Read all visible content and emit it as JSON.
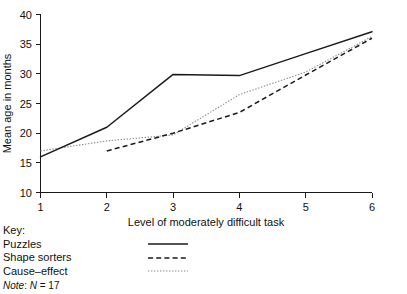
{
  "chart_data": {
    "type": "line",
    "title": "",
    "xlabel": "Level of moderately difficult task",
    "ylabel": "Mean age in months",
    "x": [
      1,
      2,
      3,
      4,
      5,
      6
    ],
    "xlim": [
      1,
      6
    ],
    "ylim": [
      10,
      40
    ],
    "xticks": [
      "1",
      "2",
      "3",
      "4",
      "5",
      "6"
    ],
    "yticks": [
      "10",
      "15",
      "20",
      "25",
      "30",
      "35",
      "40"
    ],
    "grid": false,
    "legend_position": "below-left",
    "series": [
      {
        "name": "Puzzles",
        "style": "solid",
        "color": "#1a1a1a",
        "x": [
          1,
          2,
          3,
          4,
          5,
          6
        ],
        "values": [
          16.0,
          21.0,
          29.9,
          29.7,
          33.4,
          37.1
        ]
      },
      {
        "name": "Shape sorters",
        "style": "dashed",
        "color": "#1a1a1a",
        "x": [
          2,
          3,
          4,
          5,
          6
        ],
        "values": [
          17.0,
          20.0,
          23.5,
          29.8,
          36.0
        ]
      },
      {
        "name": "Cause–effect",
        "style": "dotted",
        "color": "#8a8a8a",
        "x": [
          1,
          2,
          3,
          4,
          5,
          6
        ],
        "values": [
          17.0,
          18.7,
          19.7,
          26.5,
          30.3,
          36.3
        ]
      }
    ],
    "annotations": []
  },
  "key": {
    "title": "Key:",
    "entries": [
      {
        "label": "Puzzles",
        "style": "solid"
      },
      {
        "label": "Shape sorters",
        "style": "dashed"
      },
      {
        "label": "Cause–effect",
        "style": "dotted"
      }
    ]
  },
  "note": {
    "word": "Note",
    "separator": ": ",
    "symbol": "N",
    "equals": " = ",
    "value": "17"
  }
}
